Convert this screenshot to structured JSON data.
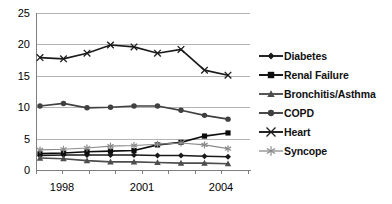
{
  "chart_data": {
    "type": "line",
    "title": "",
    "xlabel": "",
    "ylabel": "",
    "x": [
      1998,
      1999,
      2000,
      2001,
      2002,
      2003,
      2004,
      2005,
      2006
    ],
    "xtick_labels": [
      "1998",
      "",
      "",
      "2001",
      "",
      "",
      "2004",
      "",
      ""
    ],
    "xlim": [
      1997.5,
      2006.8
    ],
    "ylim": [
      0,
      25
    ],
    "ytick_labels": [
      "0",
      "5",
      "10",
      "15",
      "20",
      "25"
    ],
    "yticks": [
      0,
      5,
      10,
      15,
      20,
      25
    ],
    "grid": "horizontal",
    "legend_position": "right",
    "series": [
      {
        "name": "Diabetes",
        "marker": "diamond",
        "color": "#1a1a1a",
        "values": [
          2.3,
          2.4,
          2.4,
          2.4,
          2.4,
          2.3,
          2.3,
          2.2,
          2.1
        ]
      },
      {
        "name": "Renal Failure",
        "marker": "square",
        "color": "#0d0d0d",
        "values": [
          2.6,
          2.7,
          2.9,
          3.0,
          3.1,
          4.0,
          4.4,
          5.4,
          5.9
        ]
      },
      {
        "name": "Bronchitis/Asthma",
        "marker": "triangle",
        "color": "#4d4d4d",
        "values": [
          1.9,
          1.8,
          1.5,
          1.3,
          1.3,
          1.2,
          1.1,
          1.1,
          1.0
        ]
      },
      {
        "name": "COPD",
        "marker": "circle",
        "color": "#404040",
        "values": [
          10.2,
          10.6,
          9.9,
          10.0,
          10.2,
          10.2,
          9.5,
          8.7,
          8.1
        ]
      },
      {
        "name": "Heart",
        "marker": "cross",
        "color": "#1a1a1a",
        "values": [
          17.9,
          17.7,
          18.6,
          19.9,
          19.6,
          18.6,
          19.2,
          15.9,
          15.1
        ]
      },
      {
        "name": "Syncope",
        "marker": "asterisk",
        "color": "#8c8c8c",
        "values": [
          3.2,
          3.3,
          3.5,
          3.8,
          3.9,
          4.1,
          4.3,
          4.0,
          3.4
        ]
      }
    ]
  },
  "legend": {
    "items": [
      {
        "label": "Diabetes"
      },
      {
        "label": "Renal Failure"
      },
      {
        "label": "Bronchitis/Asthma"
      },
      {
        "label": "COPD"
      },
      {
        "label": "Heart"
      },
      {
        "label": "Syncope"
      }
    ]
  },
  "axes": {
    "y_labels": [
      "25",
      "20",
      "15",
      "10",
      "5",
      "0"
    ],
    "x_labels": [
      "1998",
      "2001",
      "2004"
    ]
  }
}
